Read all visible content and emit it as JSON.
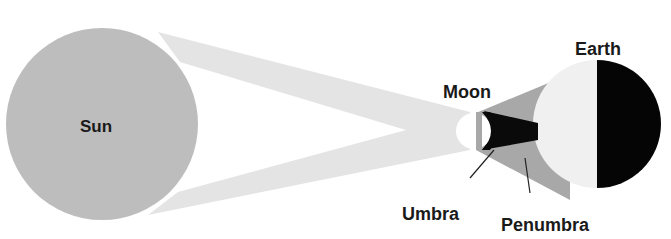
{
  "diagram": {
    "type": "solar-eclipse",
    "colors": {
      "sun": "#bdbdbd",
      "light_cone": "#e4e4e4",
      "moon": "#ffffff",
      "penumbra": "#a8a8a8",
      "umbra": "#0a0a0a",
      "earth_day": "#f0f0f0",
      "earth_night": "#050505",
      "label": "#1a1a1a"
    },
    "labels": {
      "sun": "Sun",
      "moon": "Moon",
      "earth": "Earth",
      "umbra": "Umbra",
      "penumbra": "Penumbra"
    },
    "nodes": [
      {
        "id": "sun",
        "label": "Sun",
        "cx": 102,
        "cy": 124,
        "r": 96
      },
      {
        "id": "moon",
        "label": "Moon",
        "cx": 474,
        "cy": 131,
        "r": 18
      },
      {
        "id": "earth",
        "label": "Earth",
        "cx": 599,
        "cy": 124,
        "r": 64
      }
    ],
    "edges": [
      {
        "from": "sun",
        "to": "moon",
        "kind": "light-cone"
      },
      {
        "from": "moon",
        "to": "earth",
        "kind": "penumbra"
      },
      {
        "from": "moon",
        "to": "earth",
        "kind": "umbra"
      },
      {
        "from": "umbra-label",
        "to": "umbra",
        "kind": "leader-line"
      },
      {
        "from": "penumbra-label",
        "to": "penumbra",
        "kind": "leader-line"
      }
    ]
  }
}
